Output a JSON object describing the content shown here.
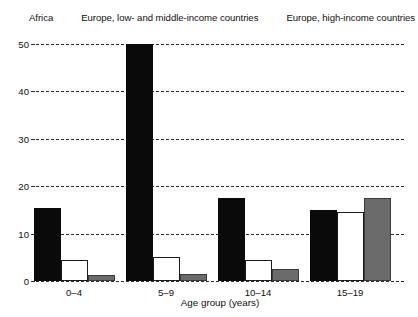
{
  "legend": {
    "items": [
      {
        "label": "Africa",
        "swatch": "black-square-icon",
        "color": "#0a0a0a"
      },
      {
        "label": "Europe, low- and middle-income countries",
        "swatch": "white-square-icon",
        "color": "#ffffff"
      },
      {
        "label": "Europe, high-income countries",
        "swatch": "gray-square-icon",
        "color": "#6b6b6b"
      }
    ]
  },
  "axes": {
    "x_title": "Age group (years)",
    "y_ticks": [
      "0",
      "10",
      "20",
      "30",
      "40",
      "50"
    ]
  },
  "chart_data": {
    "type": "bar",
    "title": "",
    "xlabel": "Age group (years)",
    "ylabel": "",
    "categories": [
      "0–4",
      "5–9",
      "10–14",
      "15–19"
    ],
    "series": [
      {
        "name": "Africa",
        "color": "#0a0a0a",
        "values": [
          15.5,
          50,
          17.5,
          15
        ]
      },
      {
        "name": "Europe, low- and middle-income countries",
        "color": "#ffffff",
        "values": [
          4.5,
          5,
          4.5,
          14.5
        ]
      },
      {
        "name": "Europe, high-income countries",
        "color": "#6b6b6b",
        "values": [
          1.3,
          1.5,
          2.5,
          17.5
        ]
      }
    ],
    "ylim": [
      0,
      50
    ],
    "ytick_values": [
      0,
      10,
      20,
      30,
      40,
      50
    ],
    "grid": "horizontal-dashed",
    "legend_position": "top"
  }
}
